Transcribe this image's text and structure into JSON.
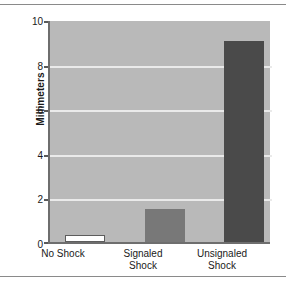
{
  "chart_data": {
    "type": "bar",
    "title": "",
    "xlabel": "",
    "ylabel": "Millimeters",
    "categories": [
      "No Shock",
      "Signaled Shock",
      "Unsignaled Shock"
    ],
    "category_lines": [
      [
        "No Shock"
      ],
      [
        "Signaled",
        "Shock"
      ],
      [
        "Unsignaled",
        "Shock"
      ]
    ],
    "values": [
      0.3,
      1.5,
      9.1
    ],
    "ylim": [
      0,
      10
    ],
    "yticks": [
      0,
      2,
      4,
      6,
      8,
      10
    ],
    "ytick_labels": [
      "0",
      "2",
      "4",
      "6",
      "8",
      "10"
    ],
    "grid": true,
    "gridlines_at": [
      2,
      4,
      6,
      8
    ],
    "legend": "none",
    "bar_colors": [
      "#ffffff",
      "#787878",
      "#4a4a4a"
    ],
    "plot_background": "#b9b9b9",
    "gridline_color": "#eaeaea",
    "axis_color": "#6e6e6e"
  },
  "figure": {
    "ylabel": "Millimeters",
    "bars": [
      {
        "label": "No Shock",
        "line1": "No Shock",
        "line2": "",
        "value": 0.3,
        "style": "white"
      },
      {
        "label": "Signaled Shock",
        "line1": "Signaled",
        "line2": "Shock",
        "value": 1.5,
        "style": "mid"
      },
      {
        "label": "Unsignaled Shock",
        "line1": "Unsignaled",
        "line2": "Shock",
        "value": 9.1,
        "style": "dark"
      }
    ],
    "yticks": [
      "10",
      "8",
      "6",
      "4",
      "2",
      "0"
    ]
  }
}
